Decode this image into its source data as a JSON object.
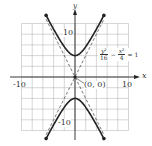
{
  "chart_data": {
    "type": "line",
    "title": "",
    "xlabel": "x",
    "ylabel": "y",
    "xlim": [
      -10,
      10
    ],
    "ylim": [
      -10,
      10
    ],
    "grid": true,
    "grid_step": 2,
    "x_tick_labels": [
      "-10",
      "10"
    ],
    "y_tick_labels": [
      "10",
      "-10"
    ],
    "equation": {
      "num1": "y²",
      "den1": "16",
      "minus": "−",
      "num2": "x²",
      "den2": "4",
      "equals": "= 1"
    },
    "center_label": "(0, 0)",
    "center": [
      0,
      0
    ],
    "vertices": [
      [
        0,
        4
      ],
      [
        0,
        -4
      ]
    ],
    "asymptotes": [
      "y = 2x",
      "y = -2x"
    ],
    "series": [
      {
        "name": "hyperbola upper branch",
        "style": "solid",
        "x": [
          -5.4,
          -4,
          -2,
          0,
          2,
          4,
          5.4
        ],
        "y": [
          10.1,
          8.94,
          5.66,
          4,
          5.66,
          8.94,
          10.1
        ]
      },
      {
        "name": "hyperbola lower branch",
        "style": "solid",
        "x": [
          -5.4,
          -4,
          -2,
          0,
          2,
          4,
          5.4
        ],
        "y": [
          -10.1,
          -8.94,
          -5.66,
          -4,
          -5.66,
          -8.94,
          -10.1
        ]
      },
      {
        "name": "asymptote y=2x",
        "style": "dashed",
        "x": [
          -5.4,
          5.4
        ],
        "y": [
          -10.8,
          10.8
        ]
      },
      {
        "name": "asymptote y=-2x",
        "style": "dashed",
        "x": [
          -5.4,
          5.4
        ],
        "y": [
          10.8,
          -10.8
        ]
      }
    ],
    "colors": {
      "curve": "#222222",
      "grid": "#bbbbbb",
      "axis": "#222222",
      "asymptote": "#555555"
    }
  }
}
